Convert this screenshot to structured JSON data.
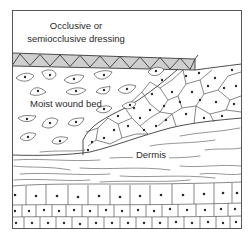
{
  "diagram": {
    "labels": {
      "dressing_line1": "Occlusive or",
      "dressing_line2": "semiocclusive dressing",
      "wound_bed": "Moist wound bed",
      "dermis": "Dermis"
    },
    "regions": [
      {
        "name": "occlusive-dressing",
        "fill": "#cfcfcf"
      },
      {
        "name": "moist-wound-bed",
        "fill": "#ffffff"
      },
      {
        "name": "migrating-epidermis",
        "fill": "#ffffff"
      },
      {
        "name": "dermis",
        "fill": "#ffffff"
      },
      {
        "name": "basal-cell-layers",
        "rows": 3
      }
    ],
    "colors": {
      "background": "#ffffff",
      "frame": "#555555",
      "dressing_fill": "#cfcfcf",
      "line": "#3a3a3a",
      "nucleus": "#2a2a2a"
    }
  }
}
